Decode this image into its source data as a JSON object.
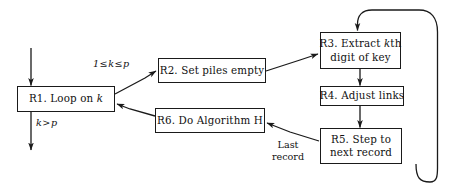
{
  "diagram": {
    "type": "flowchart",
    "title": "",
    "background_color": "#ffffff",
    "line_color": "#1a1a1a",
    "text_color": "#111111",
    "nodes": [
      {
        "id": "R1",
        "label_line1": "R1. Loop on k",
        "label_line2": "",
        "x": 17,
        "y": 86,
        "w": 98,
        "h": 26
      },
      {
        "id": "R2",
        "label_line1": "R2. Set piles empty",
        "label_line2": "",
        "x": 158,
        "y": 58,
        "w": 108,
        "h": 25
      },
      {
        "id": "R3",
        "label_line1": "R3. Extract kth",
        "label_line2": "digit of key",
        "x": 320,
        "y": 32,
        "w": 81,
        "h": 37
      },
      {
        "id": "R4",
        "label_line1": "R4. Adjust links",
        "label_line2": "",
        "x": 320,
        "y": 86,
        "w": 84,
        "h": 20
      },
      {
        "id": "R5",
        "label_line1": "R5. Step to",
        "label_line2": "next record",
        "x": 320,
        "y": 128,
        "w": 82,
        "h": 36
      },
      {
        "id": "R6",
        "label_line1": "R6. Do Algorithm H",
        "label_line2": "",
        "x": 155,
        "y": 108,
        "w": 110,
        "h": 25
      }
    ],
    "edge_labels": [
      {
        "id": "loop-continue",
        "text": "1 ≤ k ≤ p",
        "x": 93,
        "y": 58
      },
      {
        "id": "loop-exit",
        "text": "k > p",
        "x": 36,
        "y": 117
      },
      {
        "id": "last-record",
        "line1": "Last",
        "line2": "record",
        "x": 268,
        "y": 139
      }
    ],
    "edges": [
      {
        "from": "entry",
        "to": "R1",
        "kind": "straight-arrow"
      },
      {
        "from": "R1",
        "to": "R2",
        "kind": "diagonal-arrow",
        "label": "1 ≤ k ≤ p"
      },
      {
        "from": "R1",
        "to": "exit",
        "kind": "straight-arrow",
        "label": "k > p"
      },
      {
        "from": "R2",
        "to": "R3",
        "kind": "diagonal-arrow"
      },
      {
        "from": "R3",
        "to": "R4",
        "kind": "straight-arrow"
      },
      {
        "from": "R4",
        "to": "R5",
        "kind": "straight-arrow"
      },
      {
        "from": "R5",
        "to": "R3",
        "kind": "loop-back-arc"
      },
      {
        "from": "R5",
        "to": "R6",
        "kind": "diagonal-arrow",
        "label": "Last record"
      },
      {
        "from": "R6",
        "to": "R1",
        "kind": "diagonal-arrow"
      }
    ]
  }
}
